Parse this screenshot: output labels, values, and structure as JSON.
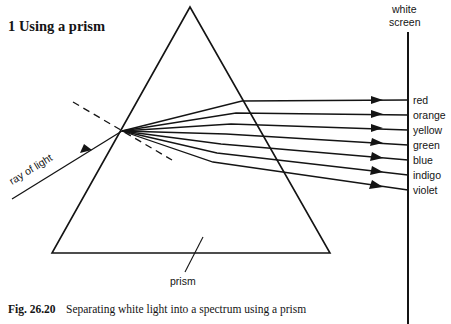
{
  "figure": {
    "title": "1  Using a prism",
    "caption_prefix": "Fig. 26.20",
    "caption_text": "Separating white light into a spectrum using a prism",
    "line_color": "#141414",
    "background_color": "#ffffff"
  },
  "labels": {
    "screen_line1": "white",
    "screen_line2": "screen",
    "incoming_ray": "ray of light",
    "prism": "prism"
  },
  "spectrum": {
    "colors": [
      {
        "name": "red",
        "y": 100
      },
      {
        "name": "orange",
        "y": 115
      },
      {
        "name": "yellow",
        "y": 130
      },
      {
        "name": "green",
        "y": 145
      },
      {
        "name": "blue",
        "y": 160
      },
      {
        "name": "indigo",
        "y": 175
      },
      {
        "name": "violet",
        "y": 190
      }
    ]
  },
  "geometry": {
    "prism": {
      "apex_x": 190,
      "apex_y": 7,
      "left_x": 52,
      "left_y": 253,
      "right_x": 330,
      "right_y": 253
    },
    "refraction_point": {
      "x": 122,
      "y": 131
    },
    "screen_x": 408,
    "screen_top_y": 32,
    "screen_bottom_y": 324
  }
}
